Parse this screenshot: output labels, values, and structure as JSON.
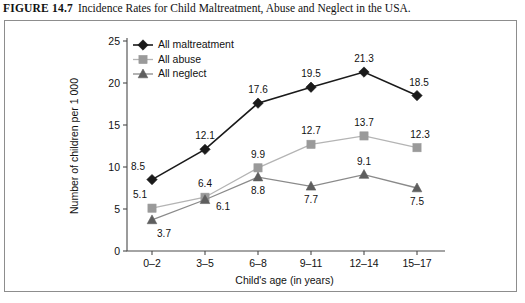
{
  "figure": {
    "number_label": "FIGURE 14.7",
    "caption": "Incidence Rates for Child Maltreatment, Abuse and Neglect in the USA."
  },
  "chart_data": {
    "type": "line",
    "title": "",
    "xlabel": "Child's age (in years)",
    "ylabel": "Number of children per 1 000",
    "categories": [
      "0–2",
      "3–5",
      "6–8",
      "9–11",
      "12–14",
      "15–17"
    ],
    "ylim": [
      0,
      25
    ],
    "yticks": [
      0,
      5,
      10,
      15,
      20,
      25
    ],
    "ytick_labels": [
      "0",
      "5",
      "10",
      "15",
      "20",
      "25"
    ],
    "grid": false,
    "legend_position": "top-left",
    "series": [
      {
        "name": "All maltreatment",
        "marker": "diamond",
        "color": "#1a1a1a",
        "line_color": "#1a1a1a",
        "values": [
          8.5,
          12.1,
          17.6,
          19.5,
          21.3,
          18.5
        ],
        "value_labels": [
          "8.5",
          "12.1",
          "17.6",
          "19.5",
          "21.3",
          "18.5"
        ]
      },
      {
        "name": "All abuse",
        "marker": "square",
        "color": "#9a9a9a",
        "line_color": "#b4b4b4",
        "values": [
          5.1,
          6.4,
          9.9,
          12.7,
          13.7,
          12.3
        ],
        "value_labels": [
          "5.1",
          "6.4",
          "9.9",
          "12.7",
          "13.7",
          "12.3"
        ]
      },
      {
        "name": "All neglect",
        "marker": "triangle",
        "color": "#5e5e5e",
        "line_color": "#8a8a8a",
        "values": [
          3.7,
          6.1,
          8.8,
          7.7,
          9.1,
          7.5
        ],
        "value_labels": [
          "3.7",
          "6.1",
          "8.8",
          "7.7",
          "9.1",
          "7.5"
        ]
      }
    ]
  }
}
